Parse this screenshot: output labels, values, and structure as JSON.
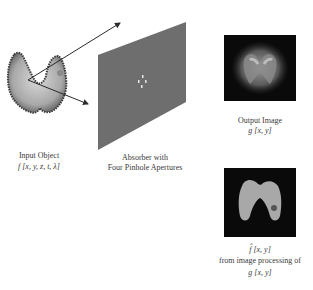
{
  "diagram": {
    "input_object": {
      "title": "Input Object",
      "formula": "f [x, y, z, t, λ]"
    },
    "absorber": {
      "line1": "Absorber with",
      "line2": "Four Pinhole Apertures",
      "pinhole_count": 4
    },
    "output_image": {
      "title": "Output Image",
      "formula": "g [x, y]"
    },
    "reconstruction": {
      "formula": "f̂ [x, y]",
      "line2": "from image processing of",
      "line3": "g [x, y]"
    },
    "colors": {
      "panel": "#6e6e6e",
      "arrow": "#2a2a2a",
      "image_bg": "#0a0a0a",
      "object_fill": "#b9b9b9",
      "object_edge": "#3a3a3a"
    }
  }
}
